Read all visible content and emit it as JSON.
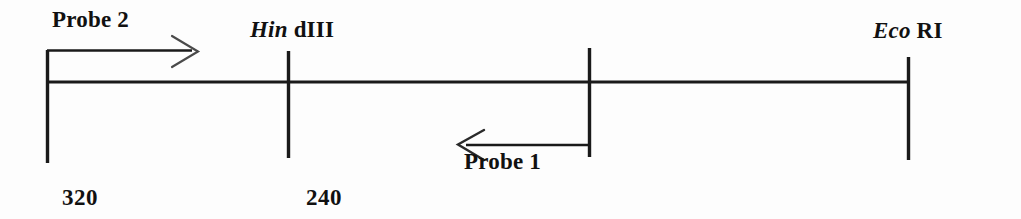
{
  "figure": {
    "kind": "restriction-map-diagram",
    "background_color": "#fdfdfd",
    "line_color": "#1a1a1a",
    "width": 1021,
    "height": 219
  },
  "labels": {
    "probe2": "Probe 2",
    "probe1": "Probe 1",
    "hindiii_italic": "Hin",
    "hindiii_roman": "dIII",
    "ecori_italic": "Eco",
    "ecori_roman": "RI",
    "size_left": "320",
    "size_middle": "240"
  },
  "map_data": {
    "type": "restriction-map",
    "backbone": {
      "x_start": 46,
      "x_end": 908,
      "y": 82
    },
    "ticks": [
      {
        "name": "left-end",
        "x": 46,
        "y_top": 50,
        "y_bottom": 163,
        "label": null
      },
      {
        "name": "hindiii",
        "x": 288,
        "y_top": 51,
        "y_bottom": 158,
        "label": "Hin dIII"
      },
      {
        "name": "middle",
        "x": 589,
        "y_top": 48,
        "y_bottom": 157,
        "label": null
      },
      {
        "name": "ecori",
        "x": 908,
        "y_top": 57,
        "y_bottom": 160,
        "label": "Eco RI"
      }
    ],
    "fragment_sizes": [
      {
        "label": "320",
        "x": 62,
        "between": [
          "left-end",
          "hindiii"
        ]
      },
      {
        "label": "240",
        "x": 306,
        "between": [
          "hindiii",
          "middle"
        ]
      }
    ],
    "probes": [
      {
        "name": "Probe 2",
        "direction": "rightward",
        "y": 50,
        "x_tail": 46,
        "x_head": 197,
        "label_position": "above-left"
      },
      {
        "name": "Probe 1",
        "direction": "leftward",
        "y": 145,
        "x_tail": 589,
        "x_head": 458,
        "label_position": "below-right"
      }
    ]
  }
}
